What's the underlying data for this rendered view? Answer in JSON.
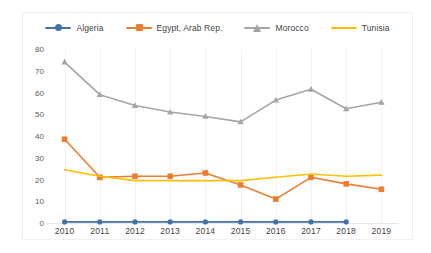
{
  "chart_data": {
    "type": "line",
    "title": "",
    "xlabel": "",
    "ylabel": "",
    "x": [
      2010,
      2011,
      2012,
      2013,
      2014,
      2015,
      2016,
      2017,
      2018,
      2019
    ],
    "xtick_labels": [
      "2010",
      "2011",
      "2012",
      "2013",
      "2014",
      "2015",
      "2016",
      "2017",
      "2018",
      "2019"
    ],
    "ytick_labels": [
      "80",
      "70",
      "60",
      "50",
      "40",
      "30",
      "20",
      "10",
      "0"
    ],
    "ytick_values": [
      80,
      70,
      60,
      50,
      40,
      30,
      20,
      10,
      0
    ],
    "ylim": [
      0,
      80
    ],
    "grid": "vertical",
    "legend_position": "top-center",
    "series": [
      {
        "name": "Algeria",
        "color": "#4472a8",
        "marker": "circle",
        "values": [
          0.5,
          0.5,
          0.5,
          0.5,
          0.5,
          0.5,
          0.5,
          0.5,
          0.5,
          null
        ]
      },
      {
        "name": "Egypt, Arab Rep.",
        "color": "#ed7d31",
        "marker": "square",
        "values": [
          38.5,
          21.0,
          21.5,
          21.5,
          23.0,
          17.5,
          11.0,
          21.0,
          18.0,
          15.5
        ]
      },
      {
        "name": "Morocco",
        "color": "#a5a5a5",
        "marker": "triangle",
        "values": [
          74.0,
          59.0,
          54.0,
          51.0,
          49.0,
          46.5,
          56.5,
          61.5,
          52.5,
          55.5
        ]
      },
      {
        "name": "Tunisia",
        "color": "#ffc000",
        "marker": "none",
        "values": [
          24.5,
          21.5,
          19.5,
          19.5,
          19.5,
          19.5,
          21.0,
          22.5,
          21.5,
          22.0
        ]
      }
    ]
  },
  "legend": {
    "items": [
      {
        "label": "Algeria",
        "color": "#4472a8",
        "marker": "circle"
      },
      {
        "label": "Egypt, Arab Rep.",
        "color": "#ed7d31",
        "marker": "square"
      },
      {
        "label": "Morocco",
        "color": "#a5a5a5",
        "marker": "triangle"
      },
      {
        "label": "Tunisia",
        "color": "#ffc000",
        "marker": "none"
      }
    ]
  }
}
